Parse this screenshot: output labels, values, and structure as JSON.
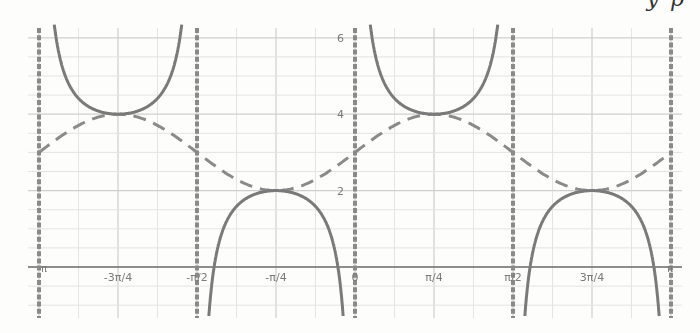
{
  "cut_text": "y p",
  "chart_data": {
    "type": "line",
    "title": "",
    "xlabel": "",
    "ylabel": "",
    "xlim": [
      "-π",
      "π"
    ],
    "ylim": [
      -1.3,
      6.3
    ],
    "grid": true,
    "x_tick_labels": [
      "-π",
      "-3π/4",
      "-π/2",
      "-π/4",
      "0",
      "π/4",
      "π/2",
      "3π/4",
      "π"
    ],
    "y_tick_labels": [
      "2",
      "4",
      "6"
    ],
    "series": [
      {
        "name": "y = 3 + sin(2x)",
        "style": "dashed",
        "color": "#8a8a8a",
        "points": [
          {
            "x": "-π",
            "y": 3
          },
          {
            "x": "-3π/4",
            "y": 4
          },
          {
            "x": "-π/2",
            "y": 3
          },
          {
            "x": "-π/4",
            "y": 2
          },
          {
            "x": "0",
            "y": 3
          },
          {
            "x": "π/4",
            "y": 4
          },
          {
            "x": "π/2",
            "y": 3
          },
          {
            "x": "3π/4",
            "y": 2
          },
          {
            "x": "π",
            "y": 3
          }
        ]
      },
      {
        "name": "y = 3 + csc(2x)",
        "style": "solid",
        "color": "#7a7a7a",
        "local_extrema": [
          {
            "x": "-3π/4",
            "y": 4,
            "type": "min"
          },
          {
            "x": "-π/4",
            "y": 2,
            "type": "max"
          },
          {
            "x": "π/4",
            "y": 4,
            "type": "min"
          },
          {
            "x": "3π/4",
            "y": 2,
            "type": "max"
          }
        ]
      }
    ],
    "asymptotes": {
      "style": "dotted-thick",
      "color": "#8a8a8a",
      "x": [
        "-π",
        "-π/2",
        "0",
        "π/2",
        "π"
      ]
    }
  },
  "colors": {
    "grid_minor": "#e4e4e4",
    "grid_major": "#cfcfcf",
    "axis": "#6f6f6f",
    "curve": "#858585",
    "label": "#7a7a7a"
  }
}
